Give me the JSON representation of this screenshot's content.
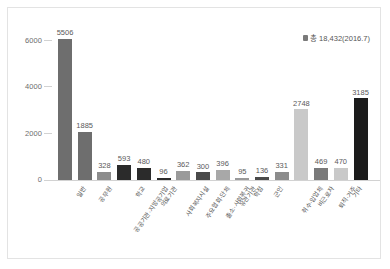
{
  "chart_data": {
    "type": "bar",
    "title": "",
    "subtitle": "",
    "xlabel": "",
    "ylabel": "",
    "ylim": [
      0,
      6000
    ],
    "yticks": [
      0,
      2000,
      4000,
      6000
    ],
    "ytick_labels": [
      "0",
      "2000",
      "4000",
      "6000"
    ],
    "grid": false,
    "legend": "none",
    "annotation": "총 18,432(2016.7)",
    "annotation_marker": "total-marker",
    "categories": [
      "일반",
      "공무원",
      "공공기관·지방공기업",
      "학교",
      "의료기관",
      "사회복지시설",
      "주요협회·단체",
      "출소·사회복귀",
      "유관기관",
      "학점",
      "군인",
      "취수·입업체",
      "비근로자",
      "퇴직·거주",
      "기타",
      "의사·간호사·약사(의료인)"
    ],
    "values": [
      5506,
      1885,
      328,
      593,
      480,
      96,
      362,
      300,
      396,
      95,
      136,
      331,
      2748,
      469,
      470,
      3185
    ],
    "bar_colors": [
      "#6e6e6e",
      "#6e6e6e",
      "#8c8c8c",
      "#2b2b2b",
      "#2b2b2b",
      "#2b2b2b",
      "#9a9a9a",
      "#4a4a4a",
      "#a8a8a8",
      "#9a9a9a",
      "#4a4a4a",
      "#8c8c8c",
      "#c9c9c9",
      "#7a7a7a",
      "#c9c9c9",
      "#1c1c1c"
    ],
    "value_labels": [
      "5506",
      "1885",
      "328",
      "593",
      "480",
      "96",
      "362",
      "300",
      "396",
      "95",
      "136",
      "331",
      "2748",
      "469",
      "470",
      "3185"
    ]
  }
}
